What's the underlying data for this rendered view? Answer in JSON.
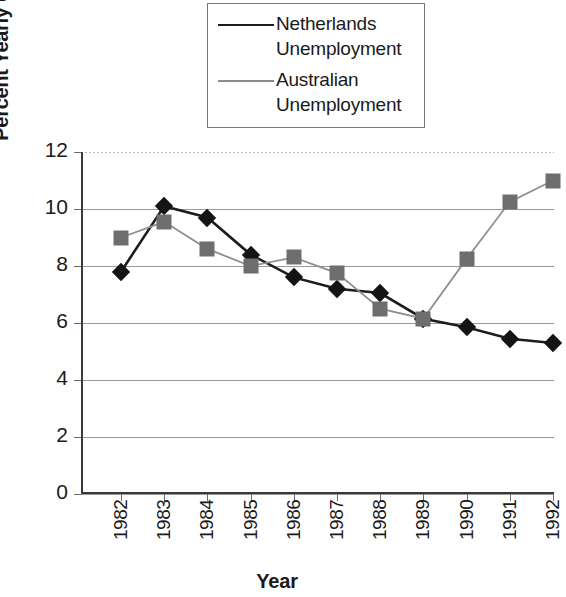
{
  "chart_data": {
    "type": "line",
    "title": "",
    "xlabel": "Year",
    "ylabel": "Percent Yearly Unemployment",
    "categories": [
      "1982",
      "1983",
      "1984",
      "1985",
      "1986",
      "1987",
      "1988",
      "1989",
      "1990",
      "1991",
      "1992"
    ],
    "ylim": [
      0,
      12
    ],
    "yticks": [
      0,
      2,
      4,
      6,
      8,
      10,
      12
    ],
    "grid": true,
    "legend_position": "top-center",
    "series": [
      {
        "name": "Netherlands Unemployment",
        "marker": "diamond",
        "color": "#141414",
        "values": [
          7.8,
          10.1,
          9.7,
          8.4,
          7.6,
          7.2,
          7.05,
          6.15,
          5.85,
          5.45,
          5.3
        ]
      },
      {
        "name": "Australian Unemployment",
        "marker": "square",
        "color": "#6e6e6e",
        "values": [
          9.0,
          9.55,
          8.6,
          8.0,
          8.3,
          7.75,
          6.5,
          6.15,
          8.25,
          10.25,
          11.0
        ]
      }
    ]
  },
  "legend": {
    "entries": [
      {
        "label": "Netherlands\nUnemployment",
        "marker": "diamond-marker",
        "color": "#141414"
      },
      {
        "label": "Australian\nUnemployment",
        "marker": "square-marker",
        "color": "#6e6e6e"
      }
    ]
  },
  "axes": {
    "y_title": "Percent Yearly Unemployment",
    "x_title": "Year",
    "y_tick_labels": [
      "12",
      "10",
      "8",
      "6",
      "4",
      "2",
      "0"
    ],
    "x_tick_labels": [
      "1982",
      "1983",
      "1984",
      "1985",
      "1986",
      "1987",
      "1988",
      "1989",
      "1990",
      "1991",
      "1992"
    ]
  }
}
